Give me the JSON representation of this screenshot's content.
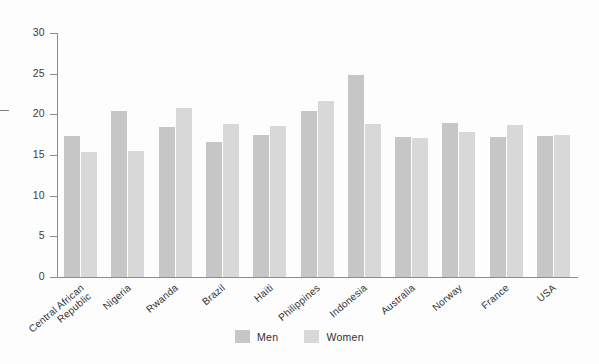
{
  "chart_data": {
    "type": "bar",
    "title": "",
    "subtitle": "",
    "xlabel": "",
    "ylabel": "",
    "ylim": [
      0,
      30
    ],
    "yticks": [
      0,
      5,
      10,
      15,
      20,
      25,
      30
    ],
    "ytick_labels": [
      "0",
      "5",
      "10",
      "15",
      "20",
      "25",
      "30"
    ],
    "grid": false,
    "legend_position": "bottom-center",
    "categories": [
      "Central African\nRepublic",
      "Nigeria",
      "Rwanda",
      "Brazil",
      "Haiti",
      "Philippines",
      "Indonesia",
      "Australia",
      "Norway",
      "France",
      "USA"
    ],
    "series": [
      {
        "name": "Men",
        "color": "#c6c6c6",
        "values": [
          17.3,
          20.4,
          18.4,
          16.6,
          17.4,
          20.4,
          24.8,
          17.2,
          18.9,
          17.2,
          17.3
        ]
      },
      {
        "name": "Women",
        "color": "#d8d8d8",
        "values": [
          15.4,
          15.5,
          20.8,
          18.8,
          18.6,
          21.6,
          18.8,
          17.1,
          17.8,
          18.7,
          17.5
        ]
      }
    ]
  },
  "legend": {
    "items": [
      {
        "label": "Men",
        "color": "#c6c6c6"
      },
      {
        "label": "Women",
        "color": "#d8d8d8"
      }
    ]
  },
  "colors": {
    "men": "#c6c6c6",
    "women": "#d8d8d8",
    "axis": "#8c8c8c",
    "text": "#2f2f2f",
    "background": "#fdfdfd"
  }
}
